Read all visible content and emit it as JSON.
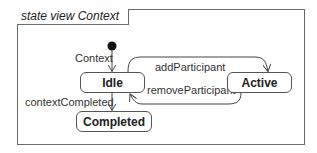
{
  "diagram": {
    "type": "uml-state-machine",
    "frame": {
      "title": "state view Context"
    },
    "initial": {
      "label": "Context"
    },
    "states": [
      {
        "id": "idle",
        "label": "Idle"
      },
      {
        "id": "active",
        "label": "Active"
      },
      {
        "id": "completed",
        "label": "Completed"
      }
    ],
    "transitions": [
      {
        "from": "initial",
        "to": "idle",
        "label": "Context"
      },
      {
        "from": "idle",
        "to": "active",
        "label": "addParticipant"
      },
      {
        "from": "active",
        "to": "idle",
        "label": "removeParticipant"
      },
      {
        "from": "idle",
        "to": "completed",
        "label": "contextCompleted"
      }
    ],
    "colors": {
      "line": "#555555",
      "frame": "#6a6a6a",
      "text": "#222222",
      "background": "#ffffff"
    }
  }
}
